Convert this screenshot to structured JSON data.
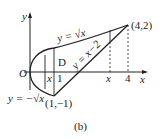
{
  "figure": {
    "caption": "(b)",
    "axes": {
      "x_label": "x",
      "y_label": "y",
      "origin_label": "O"
    },
    "curves": [
      {
        "label": "y = √x",
        "type": "upper-parabola-branch"
      },
      {
        "label": "y = −√x",
        "type": "lower-parabola-branch"
      },
      {
        "label": "y = x−2",
        "type": "line"
      }
    ],
    "points": [
      {
        "label": "(4,2)",
        "x": 4,
        "y": 2
      },
      {
        "label": "(1,−1)",
        "x": 1,
        "y": -1
      }
    ],
    "region_label": "D",
    "tick_labels": {
      "one": "1",
      "four": "4",
      "x_left": "x",
      "x_right": "x"
    }
  }
}
